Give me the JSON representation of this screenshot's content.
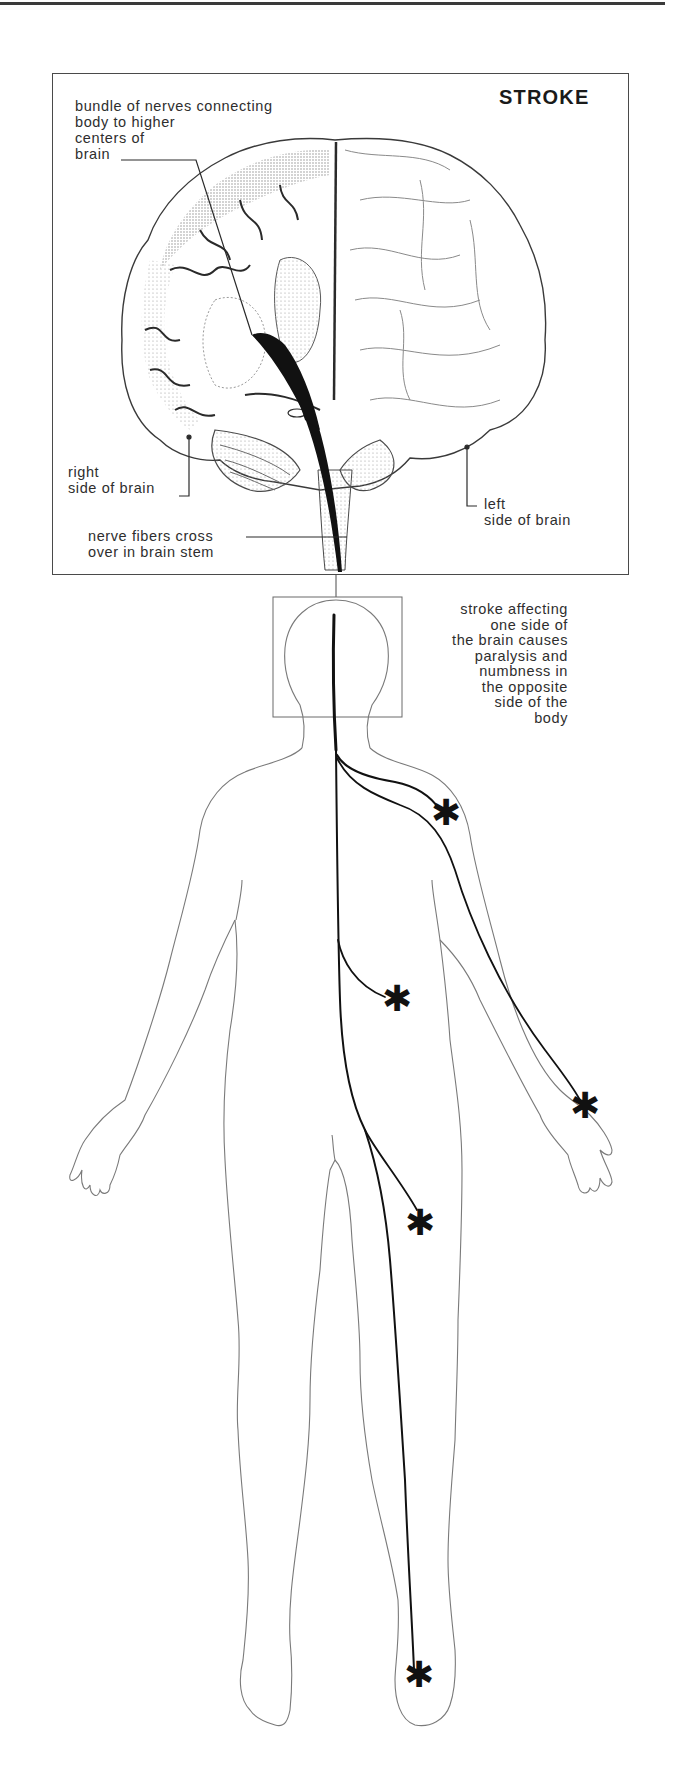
{
  "figure": {
    "title": "STROKE",
    "labels": {
      "bundle": "bundle of nerves connecting\nbody to higher\ncenters of\nbrain",
      "right_side": "right\nside of brain",
      "left_side": "left\nside of brain",
      "cross_over": "nerve fibers cross\nover in brain stem",
      "caption": "stroke affecting\none side of\nthe brain causes\nparalysis and\nnumbness in\nthe opposite\nside of the\nbody"
    },
    "markers": [
      {
        "name": "shoulder",
        "glyph": "✱"
      },
      {
        "name": "abdomen",
        "glyph": "✱"
      },
      {
        "name": "hand",
        "glyph": "✱"
      },
      {
        "name": "thigh",
        "glyph": "✱"
      },
      {
        "name": "foot",
        "glyph": "✱"
      }
    ],
    "colors": {
      "ink": "#1a1a1a",
      "outline": "#6a6a6a",
      "stipple": "#bdbdbd"
    }
  }
}
